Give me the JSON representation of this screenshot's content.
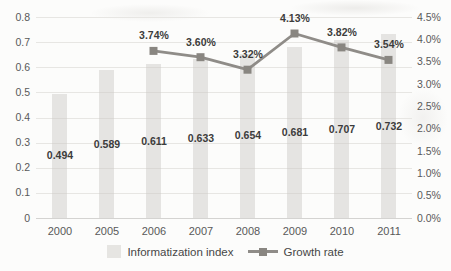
{
  "chart_data": {
    "type": "combo",
    "categories": [
      "2000",
      "2005",
      "2006",
      "2007",
      "2008",
      "2009",
      "2010",
      "2011"
    ],
    "series": [
      {
        "name": "Informatization index",
        "type": "bar",
        "axis": "left",
        "values": [
          0.494,
          0.589,
          0.611,
          0.633,
          0.654,
          0.681,
          0.707,
          0.732
        ],
        "labels": [
          "0.494",
          "0.589",
          "0.611",
          "0.633",
          "0.654",
          "0.681",
          "0.707",
          "0.732"
        ],
        "color": "#e6e5e2"
      },
      {
        "name": "Growth rate",
        "type": "line",
        "axis": "right",
        "values": [
          null,
          null,
          3.74,
          3.6,
          3.32,
          4.13,
          3.82,
          3.54
        ],
        "labels": [
          null,
          null,
          "3.74%",
          "3.60%",
          "3.32%",
          "4.13%",
          "3.82%",
          "3.54%"
        ],
        "color": "#8f8c88",
        "marker_color": "#898681"
      }
    ],
    "left_axis": {
      "min": 0,
      "max": 0.8,
      "step": 0.1,
      "ticks": [
        "0",
        "0.1",
        "0.2",
        "0.3",
        "0.4",
        "0.5",
        "0.6",
        "0.7",
        "0.8"
      ]
    },
    "right_axis": {
      "min": 0,
      "max": 4.5,
      "step": 0.5,
      "ticks": [
        "0.0%",
        "0.5%",
        "1.0%",
        "1.5%",
        "2.0%",
        "2.5%",
        "3.0%",
        "3.5%",
        "4.0%",
        "4.5%"
      ]
    },
    "grid": "horizontal",
    "legend_position": "bottom",
    "title": "",
    "xlabel": "",
    "ylabel": ""
  }
}
